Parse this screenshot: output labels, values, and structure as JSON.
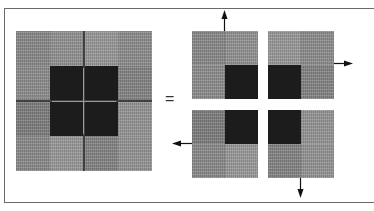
{
  "diagram": {
    "equals_symbol": "=",
    "colors": {
      "dark": "#1c1c1c",
      "gray_a": "#8c8c8c",
      "gray_b": "#999999",
      "gray_c": "#828282",
      "frame": "#6a6a6a",
      "arrow": "#111111"
    },
    "big_grid": {
      "rows": 4,
      "cols": 4,
      "dark_cells": [
        [
          1,
          1
        ],
        [
          1,
          2
        ],
        [
          2,
          1
        ],
        [
          2,
          2
        ]
      ],
      "description": "4x4 textured gray grid split into four quadrants; center 2x2 cells are dark"
    },
    "quadrants": [
      {
        "position": "top-left",
        "dark_corner": "bottom-right",
        "arrow": "up"
      },
      {
        "position": "top-right",
        "dark_corner": "bottom-left",
        "arrow": "right"
      },
      {
        "position": "bottom-left",
        "dark_corner": "top-right",
        "arrow": "left"
      },
      {
        "position": "bottom-right",
        "dark_corner": "top-left",
        "arrow": "down"
      }
    ]
  }
}
